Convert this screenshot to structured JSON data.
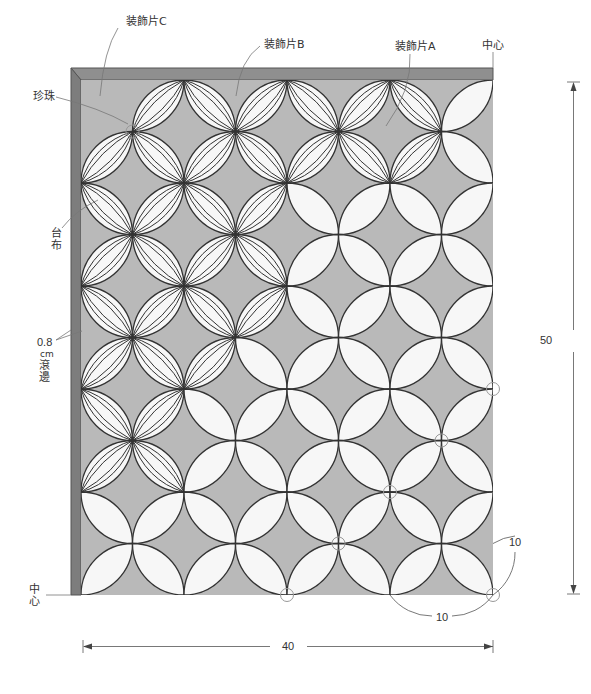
{
  "labels": {
    "piece_c": "装飾片C",
    "piece_b": "装飾片B",
    "piece_a": "装飾片A",
    "center_top": "中心",
    "pearl": "珍珠",
    "base_cloth": "台布",
    "binding_width": "0.8",
    "binding_unit": "cm",
    "binding_text": "滾邊",
    "center_left": "中心"
  },
  "dimensions": {
    "height": "50",
    "width": "40",
    "unit_h": "10",
    "unit_w": "10"
  },
  "colors": {
    "binding": "#8f8f8f",
    "binding_edge": "#555555",
    "base": "#b9b9b9",
    "petal": "#f7f7f7",
    "stroke": "#333333",
    "guide": "#777777",
    "pearl": "#999999"
  },
  "grid": {
    "origin_x": 81,
    "origin_y": 80,
    "step": 51.5,
    "cols": 8,
    "rows": 10,
    "outer_x": 71,
    "outer_y": 68,
    "decorated_cols_per_row": [
      7,
      7,
      4,
      4,
      4,
      3,
      2,
      2,
      0,
      0
    ],
    "empty_cells": [
      [
        0,
        0
      ]
    ],
    "pearls": [
      [
        1,
        1
      ],
      [
        8,
        6
      ],
      [
        7,
        7
      ],
      [
        6,
        8
      ],
      [
        5,
        9
      ],
      [
        4,
        10
      ],
      [
        8,
        10
      ]
    ]
  }
}
